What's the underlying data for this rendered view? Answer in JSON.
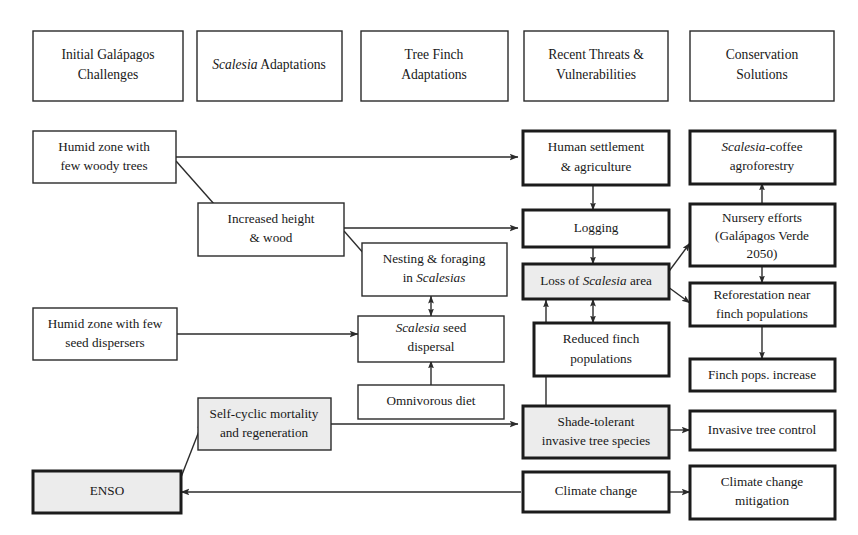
{
  "figure": {
    "type": "flow-diagram",
    "background_color": "#ffffff",
    "line_color": "#2b2b2b",
    "shaded_fill": "#ececec",
    "plain_fill": "#ffffff"
  },
  "columns": [
    {
      "id": "col-initial-challenges",
      "line1": "Initial Galápagos",
      "line2": "Challenges",
      "line1_italic": false
    },
    {
      "id": "col-scalesia-adaptations",
      "line1": "Scalesia Adaptations",
      "line2": "",
      "line1_italic_word": "Scalesia"
    },
    {
      "id": "col-tree-finch-adaptations",
      "line1": "Tree Finch",
      "line2": "Adaptations",
      "line1_italic": false
    },
    {
      "id": "col-recent-threats",
      "line1": "Recent Threats &",
      "line2": "Vulnerabilities",
      "line1_italic": false
    },
    {
      "id": "col-conservation-solutions",
      "line1": "Conservation",
      "line2": "Solutions",
      "line1_italic": false
    }
  ],
  "nodes": [
    {
      "id": "humid-woody",
      "line1": "Humid zone with",
      "line2": "few woody trees",
      "shaded": false,
      "thick": false
    },
    {
      "id": "increased-height-wood",
      "line1": "Increased height",
      "line2": "& wood",
      "shaded": false,
      "thick": false
    },
    {
      "id": "humid-seed-dispersers",
      "line1": "Humid zone with few",
      "line2": "seed dispersers",
      "shaded": false,
      "thick": false
    },
    {
      "id": "self-cyclic-mortality",
      "line1": "Self-cyclic mortality",
      "line2": "and regeneration",
      "shaded": true,
      "thick": false
    },
    {
      "id": "enso",
      "line1": "ENSO",
      "line2": "",
      "shaded": true,
      "thick": true
    },
    {
      "id": "nesting-foraging",
      "line1": "Nesting & foraging",
      "line2": "in Scalesias",
      "line2_italic_word": "Scalesias",
      "shaded": false,
      "thick": false
    },
    {
      "id": "scalesia-seed-dispersal",
      "line1": "Scalesia seed",
      "line1_italic_word": "Scalesia",
      "line2": "dispersal",
      "shaded": false,
      "thick": false
    },
    {
      "id": "omnivorous-diet",
      "line1": "Omnivorous diet",
      "line2": "",
      "shaded": false,
      "thick": false
    },
    {
      "id": "human-settlement",
      "line1": "Human settlement",
      "line2": "& agriculture",
      "shaded": false,
      "thick": true
    },
    {
      "id": "logging",
      "line1": "Logging",
      "line2": "",
      "shaded": false,
      "thick": true
    },
    {
      "id": "loss-scalesia-area",
      "line1": "Loss of Scalesia area",
      "line1_italic_word": "Scalesia",
      "line2": "",
      "shaded": true,
      "thick": true
    },
    {
      "id": "reduced-finch-populations",
      "line1": "Reduced finch",
      "line2": "populations",
      "shaded": false,
      "thick": true
    },
    {
      "id": "shade-tolerant-invasive",
      "line1": "Shade-tolerant",
      "line2": "invasive tree species",
      "shaded": true,
      "thick": true
    },
    {
      "id": "climate-change",
      "line1": "Climate change",
      "line2": "",
      "shaded": false,
      "thick": true
    },
    {
      "id": "scalesia-coffee-agroforestry",
      "line1": "Scalesia-coffee",
      "line1_italic_word": "Scalesia",
      "line2": "agroforestry",
      "shaded": false,
      "thick": true
    },
    {
      "id": "nursery-efforts",
      "line1": "Nursery efforts",
      "line2": "(Galápagos Verde",
      "line3": "2050)",
      "shaded": false,
      "thick": true
    },
    {
      "id": "reforestation-near-finch",
      "line1": "Reforestation near",
      "line2": "finch populations",
      "shaded": false,
      "thick": true
    },
    {
      "id": "finch-pops-increase",
      "line1": "Finch pops. increase",
      "line2": "",
      "shaded": false,
      "thick": true
    },
    {
      "id": "invasive-tree-control",
      "line1": "Invasive tree control",
      "line2": "",
      "shaded": false,
      "thick": true
    },
    {
      "id": "climate-change-mitigation",
      "line1": "Climate change",
      "line2": "mitigation",
      "shaded": false,
      "thick": true
    }
  ],
  "edges": [
    {
      "from": "humid-woody",
      "to": "human-settlement",
      "style": "straight",
      "arrows": "single"
    },
    {
      "from": "humid-woody",
      "to": "increased-height-wood",
      "style": "diagonal",
      "arrows": "single"
    },
    {
      "from": "increased-height-wood",
      "to": "logging",
      "style": "straight",
      "arrows": "single"
    },
    {
      "from": "increased-height-wood",
      "to": "nesting-foraging",
      "style": "diagonal",
      "arrows": "single"
    },
    {
      "from": "humid-seed-dispersers",
      "to": "scalesia-seed-dispersal",
      "style": "straight",
      "arrows": "single"
    },
    {
      "from": "nesting-foraging",
      "to": "scalesia-seed-dispersal",
      "style": "vertical",
      "arrows": "double"
    },
    {
      "from": "omnivorous-diet",
      "to": "scalesia-seed-dispersal",
      "style": "vertical",
      "arrows": "single"
    },
    {
      "from": "human-settlement",
      "to": "logging",
      "style": "vertical",
      "arrows": "single"
    },
    {
      "from": "logging",
      "to": "loss-scalesia-area",
      "style": "vertical",
      "arrows": "single"
    },
    {
      "from": "loss-scalesia-area",
      "to": "reduced-finch-populations",
      "style": "vertical",
      "arrows": "double"
    },
    {
      "from": "loss-scalesia-area",
      "to": "nursery-efforts",
      "style": "diagonal",
      "arrows": "single"
    },
    {
      "from": "loss-scalesia-area",
      "to": "reforestation-near-finch",
      "style": "diagonal",
      "arrows": "single"
    },
    {
      "from": "shade-tolerant-invasive",
      "to": "loss-scalesia-area",
      "style": "vertical",
      "arrows": "single"
    },
    {
      "from": "self-cyclic-mortality",
      "to": "shade-tolerant-invasive",
      "style": "straight",
      "arrows": "single"
    },
    {
      "from": "enso",
      "to": "self-cyclic-mortality",
      "style": "diagonal",
      "arrows": "double"
    },
    {
      "from": "climate-change",
      "to": "enso",
      "style": "straight",
      "arrows": "single"
    },
    {
      "from": "climate-change",
      "to": "climate-change-mitigation",
      "style": "straight",
      "arrows": "single"
    },
    {
      "from": "shade-tolerant-invasive",
      "to": "invasive-tree-control",
      "style": "straight",
      "arrows": "single"
    },
    {
      "from": "nursery-efforts",
      "to": "scalesia-coffee-agroforestry",
      "style": "vertical",
      "arrows": "single"
    },
    {
      "from": "nursery-efforts",
      "to": "reforestation-near-finch",
      "style": "vertical",
      "arrows": "single"
    },
    {
      "from": "reforestation-near-finch",
      "to": "finch-pops-increase",
      "style": "vertical",
      "arrows": "single"
    }
  ]
}
